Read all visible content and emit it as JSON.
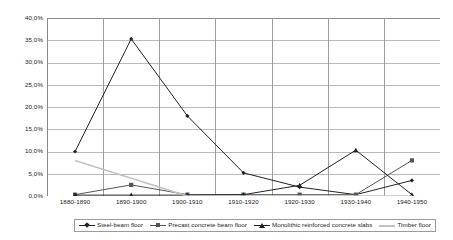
{
  "chart_data": {
    "type": "line",
    "title": "",
    "xlabel": "",
    "ylabel": "",
    "categories": [
      "1880-1890",
      "1890-1900",
      "1900-1910",
      "1910-1920",
      "1920-1930",
      "1930-1940",
      "1940-1950"
    ],
    "ylim": [
      0,
      40
    ],
    "ytick_values": [
      0,
      5,
      10,
      15,
      20,
      25,
      30,
      35,
      40
    ],
    "ytick_labels": [
      "0,0%",
      "5,0%",
      "10,0%",
      "15,0%",
      "20,0%",
      "25,0%",
      "30,0%",
      "35,0%",
      "40,0%"
    ],
    "grid": "horizontal-and-vertical",
    "legend_position": "bottom",
    "series": [
      {
        "name": "Steel-beam floor",
        "marker": "diamond",
        "color": "#222222",
        "values": [
          10.0,
          35.3,
          18.0,
          5.2,
          2.0,
          0.3,
          3.5
        ]
      },
      {
        "name": "Precast concrete beam floor",
        "marker": "square",
        "color": "#555555",
        "values": [
          0.3,
          2.5,
          0.3,
          0.3,
          0.3,
          0.3,
          8.0
        ]
      },
      {
        "name": "Monolithic reinforced concrete slabs",
        "marker": "triangle",
        "color": "#222222",
        "values": [
          0.2,
          0.2,
          0.2,
          0.3,
          2.4,
          10.3,
          0.3
        ]
      },
      {
        "name": "Timber floor",
        "marker": "none",
        "color": "#c2c2c2",
        "values": [
          8.0,
          4.0,
          0.0,
          0.0,
          0.0,
          0.0,
          0.0
        ]
      }
    ]
  },
  "legend": {
    "entries": [
      {
        "label": "Steel-beam floor"
      },
      {
        "label": "Precast concrete beam floor"
      },
      {
        "label": "Monolithic reinforced concrete slabs"
      },
      {
        "label": "Timber floor"
      }
    ]
  },
  "colors": {
    "grid": "#b9b9b9",
    "axis": "#8a8a8a",
    "background": "#ffffff",
    "text": "#1a1a1a"
  }
}
